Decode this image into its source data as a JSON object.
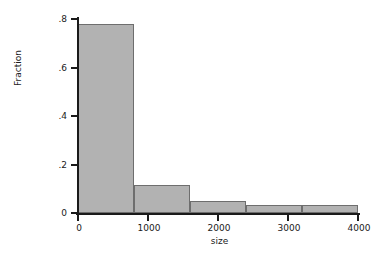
{
  "chart_data": {
    "type": "bar",
    "title": "",
    "subtitle": "",
    "xlabel": "size",
    "ylabel": "Fraction",
    "xlim": [
      0,
      4000
    ],
    "ylim": [
      0,
      0.8
    ],
    "grid": false,
    "legend": null,
    "bin_width": 800,
    "bin_edges": [
      0,
      800,
      1600,
      2400,
      3200,
      4000
    ],
    "categories": [
      "0-800",
      "800-1600",
      "1600-2400",
      "2400-3200",
      "3200-4000"
    ],
    "x": [
      400,
      1200,
      2000,
      2800,
      3600
    ],
    "values": [
      0.78,
      0.115,
      0.05,
      0.035,
      0.035
    ],
    "x_ticks": [
      0,
      1000,
      2000,
      3000,
      4000
    ],
    "x_tick_labels": [
      "0",
      "1000",
      "2000",
      "3000",
      "4000"
    ],
    "y_ticks": [
      0,
      0.2,
      0.4,
      0.6,
      0.8
    ],
    "y_tick_labels": [
      "0",
      ".2",
      ".4",
      ".6",
      ".8"
    ],
    "bar_fill_color": "#b2b2b2",
    "bar_edge_color": "#6e6e6e",
    "axis_color": "#1a1a1a",
    "background_color": "#ffffff",
    "bars": [
      {
        "label": "0-800",
        "start": 0,
        "end": 800,
        "value": 0.78
      },
      {
        "label": "800-1600",
        "start": 800,
        "end": 1600,
        "value": 0.115
      },
      {
        "label": "1600-2400",
        "start": 1600,
        "end": 2400,
        "value": 0.05
      },
      {
        "label": "2400-3200",
        "start": 2400,
        "end": 3200,
        "value": 0.035
      },
      {
        "label": "3200-4000",
        "start": 3200,
        "end": 4000,
        "value": 0.035
      }
    ]
  }
}
